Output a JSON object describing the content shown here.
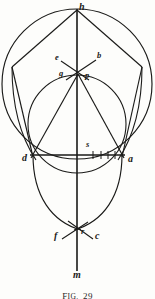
{
  "figure": {
    "caption_prefix": "F",
    "caption_small": "IG.",
    "caption_number": "29",
    "ink_color": "#1a1a18",
    "paper_color": "#fdfdfb",
    "width": 155,
    "height": 299
  },
  "labels": [
    {
      "id": "h",
      "text": "h",
      "x": 79,
      "y": 3,
      "size": "main"
    },
    {
      "id": "e",
      "text": "e",
      "x": 57,
      "y": 58,
      "size": "small"
    },
    {
      "id": "b",
      "text": "b",
      "x": 97,
      "y": 56,
      "size": "small"
    },
    {
      "id": "g",
      "text": "g",
      "x": 61,
      "y": 72,
      "size": "small"
    },
    {
      "id": "p",
      "text": "p",
      "x": 84,
      "y": 73,
      "size": "small"
    },
    {
      "id": "s",
      "text": "s",
      "x": 86,
      "y": 143,
      "size": "small"
    },
    {
      "id": "d",
      "text": "d",
      "x": 24,
      "y": 156,
      "size": "main"
    },
    {
      "id": "a",
      "text": "a",
      "x": 127,
      "y": 157,
      "size": "main"
    },
    {
      "id": "f",
      "text": "f",
      "x": 56,
      "y": 233,
      "size": "main"
    },
    {
      "id": "r",
      "text": "r",
      "x": 80,
      "y": 230,
      "size": "small"
    },
    {
      "id": "c",
      "text": "c",
      "x": 94,
      "y": 234,
      "size": "main"
    },
    {
      "id": "m",
      "text": "m",
      "x": 75,
      "y": 272,
      "size": "main"
    }
  ],
  "geometry": {
    "vertical_axis": {
      "name": "line-h-m",
      "x": 77,
      "y1": 9,
      "y2": 271
    },
    "horizontal_axis": {
      "name": "line-d-a",
      "y": 155,
      "x1": 30,
      "x2": 124
    },
    "big_circle": {
      "name": "circle-h",
      "cx": 77,
      "cy": 84,
      "r": 75
    },
    "small_circle": {
      "name": "circle-s",
      "cx": 77,
      "cy": 145,
      "r": 47
    },
    "points": {
      "h": {
        "x": 77,
        "y": 9
      },
      "left_vertex": {
        "x": 12,
        "y": 67
      },
      "right_vertex": {
        "x": 142,
        "y": 67
      },
      "p": {
        "x": 77,
        "y": 76
      },
      "d": {
        "x": 33,
        "y": 155
      },
      "a": {
        "x": 122,
        "y": 155
      },
      "s": {
        "x": 88,
        "y": 155
      },
      "r": {
        "x": 77,
        "y": 228
      },
      "m": {
        "x": 77,
        "y": 271
      }
    },
    "tick_marks": [
      {
        "x": 93,
        "y": 155
      },
      {
        "x": 101,
        "y": 155
      },
      {
        "x": 108,
        "y": 155
      },
      {
        "x": 115,
        "y": 155
      }
    ],
    "construction_rays": [
      {
        "name": "ray-e-to-p",
        "x1": 61,
        "y1": 61,
        "x2": 88,
        "y2": 79
      },
      {
        "name": "ray-b-to-g",
        "x1": 96,
        "y1": 60,
        "x2": 66,
        "y2": 79
      }
    ]
  }
}
